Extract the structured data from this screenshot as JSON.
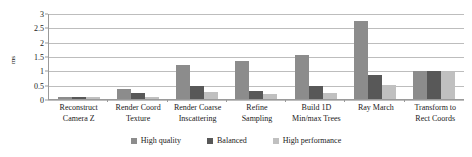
{
  "chart_data": {
    "type": "bar",
    "title": "",
    "xlabel": "",
    "ylabel": "ms",
    "ylim": [
      0,
      3
    ],
    "yticks": [
      0,
      0.5,
      1,
      1.5,
      2,
      2.5,
      3
    ],
    "ytick_labels": [
      "0",
      "0.5",
      "1",
      "1.5",
      "2",
      "2.5",
      "3"
    ],
    "grid": true,
    "legend_position": "bottom",
    "categories": [
      "Reconstruct\nCamera Z",
      "Render Coord\nTexture",
      "Render Coarse\nInscattering",
      "Refine\nSampling",
      "Build 1D\nMin/max Trees",
      "Ray March",
      "Transform to\nRect Coords"
    ],
    "category_lines": [
      [
        "Reconstruct",
        "Camera Z"
      ],
      [
        "Render Coord",
        "Texture"
      ],
      [
        "Render Coarse",
        "Inscattering"
      ],
      [
        "Refine",
        "Sampling"
      ],
      [
        "Build 1D",
        "Min/max Trees"
      ],
      [
        "Ray March",
        ""
      ],
      [
        "Transform to",
        "Rect Coords"
      ]
    ],
    "series": [
      {
        "name": "High quality",
        "color": "#8c8c8c",
        "values": [
          0.08,
          0.35,
          1.2,
          1.35,
          1.55,
          2.75,
          1.0
        ]
      },
      {
        "name": "Balanced",
        "color": "#585858",
        "values": [
          0.08,
          0.2,
          0.45,
          0.3,
          0.45,
          0.85,
          1.0
        ]
      },
      {
        "name": "High performance",
        "color": "#c0c0c0",
        "values": [
          0.08,
          0.06,
          0.25,
          0.18,
          0.22,
          0.5,
          0.95
        ]
      }
    ]
  },
  "legend": {
    "items": [
      {
        "label": "High quality",
        "color": "#8c8c8c"
      },
      {
        "label": "Balanced",
        "color": "#585858"
      },
      {
        "label": "High performance",
        "color": "#c0c0c0"
      }
    ]
  }
}
